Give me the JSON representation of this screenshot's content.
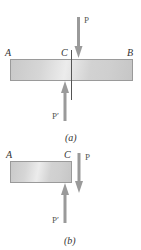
{
  "figure_a": {
    "caption": "(a)",
    "point_labels": {
      "left": "A",
      "section": "C",
      "right": "B"
    },
    "force_down": "P",
    "force_up": "P′"
  },
  "figure_b": {
    "caption": "(b)",
    "point_labels": {
      "left": "A",
      "section": "C"
    },
    "force_down": "P",
    "force_up": "P′"
  },
  "colors": {
    "arrow": "#9a9a9a",
    "bar_border": "#9a9a9a",
    "section_line": "#555555",
    "text": "#333333"
  }
}
